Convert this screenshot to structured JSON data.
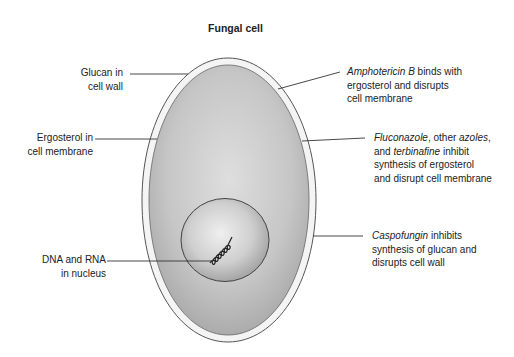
{
  "figure": {
    "title": "Fungal cell",
    "colors": {
      "background": "#ffffff",
      "cell_wall_fill": "#f4f4f4",
      "outline": "#555555",
      "cytoplasm_center": "#dcdcdc",
      "cytoplasm_edge": "#ababab",
      "nucleus_center": "#ececec",
      "nucleus_edge": "#a4a4a4",
      "leader_line": "#333333",
      "text": "#222222"
    }
  },
  "structure_labels": {
    "glucan": {
      "line1": "Glucan in",
      "line2": "cell wall"
    },
    "ergosterol": {
      "line1": "Ergosterol in",
      "line2": "cell membrane"
    },
    "dna_rna": {
      "line1": "DNA and RNA",
      "line2": "in nucleus"
    }
  },
  "drug_labels": {
    "amphotericin": {
      "drug": "Amphotericin B",
      "line1_rest": " binds with",
      "line2": "ergosterol and disrupts",
      "line3": "cell membrane"
    },
    "azoles": {
      "drug1": "Fluconazole",
      "sep1": ", other ",
      "drug2": "azoles",
      "sep2": ",",
      "line2_pre": "and ",
      "drug3": "terbinafine",
      "line2_rest": " inhibit",
      "line3": "synthesis of ergosterol",
      "line4": "and disrupt cell membrane"
    },
    "caspofungin": {
      "drug": "Caspofungin",
      "line1_rest": " inhibits",
      "line2": "synthesis of glucan and",
      "line3": "disrupts cell wall"
    }
  }
}
